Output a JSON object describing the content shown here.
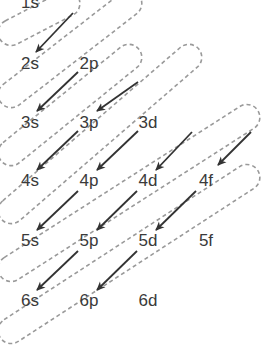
{
  "colors": {
    "label": "#3a3a3a",
    "arrow": "#333333",
    "ellipse": "#9a9a9a",
    "background": "#ffffff"
  },
  "orbitals": [
    {
      "id": "1s",
      "label": "1s",
      "x": 30,
      "y": 2
    },
    {
      "id": "2s",
      "label": "2s",
      "x": 30,
      "y": 63
    },
    {
      "id": "2p",
      "label": "2p",
      "x": 89,
      "y": 63
    },
    {
      "id": "3s",
      "label": "3s",
      "x": 30,
      "y": 122
    },
    {
      "id": "3p",
      "label": "3p",
      "x": 89,
      "y": 122
    },
    {
      "id": "3d",
      "label": "3d",
      "x": 148,
      "y": 122
    },
    {
      "id": "4s",
      "label": "4s",
      "x": 30,
      "y": 180
    },
    {
      "id": "4p",
      "label": "4p",
      "x": 89,
      "y": 180
    },
    {
      "id": "4d",
      "label": "4d",
      "x": 148,
      "y": 180
    },
    {
      "id": "4f",
      "label": "4f",
      "x": 206,
      "y": 180
    },
    {
      "id": "5s",
      "label": "5s",
      "x": 30,
      "y": 240
    },
    {
      "id": "5p",
      "label": "5p",
      "x": 89,
      "y": 240
    },
    {
      "id": "5d",
      "label": "5d",
      "x": 148,
      "y": 240
    },
    {
      "id": "5f",
      "label": "5f",
      "x": 206,
      "y": 240
    },
    {
      "id": "6s",
      "label": "6s",
      "x": 30,
      "y": 300
    },
    {
      "id": "6p",
      "label": "6p",
      "x": 89,
      "y": 300
    },
    {
      "id": "6d",
      "label": "6d",
      "x": 148,
      "y": 300
    }
  ],
  "arrows": [
    {
      "from": "1s",
      "to": "2s",
      "x1": 73,
      "y1": 13,
      "x2": 36,
      "y2": 52
    },
    {
      "from": "2p",
      "to": "3s",
      "x1": 78,
      "y1": 72,
      "x2": 37,
      "y2": 111
    },
    {
      "from": "3d",
      "to": "3p",
      "x1": 138,
      "y1": 82,
      "x2": 97,
      "y2": 111
    },
    {
      "from": "3p",
      "to": "4s",
      "x1": 78,
      "y1": 131,
      "x2": 37,
      "y2": 170
    },
    {
      "from": "4d",
      "to": "4p",
      "x1": 138,
      "y1": 131,
      "x2": 97,
      "y2": 170
    },
    {
      "from": "4f-top",
      "to": "4d",
      "x1": 192,
      "y1": 132,
      "x2": 156,
      "y2": 170
    },
    {
      "from": "4f-top2",
      "to": "4f",
      "x1": 251,
      "y1": 132,
      "x2": 218,
      "y2": 165
    },
    {
      "from": "4p",
      "to": "5s",
      "x1": 78,
      "y1": 191,
      "x2": 37,
      "y2": 230
    },
    {
      "from": "4d",
      "to": "5p",
      "x1": 137,
      "y1": 191,
      "x2": 97,
      "y2": 230
    },
    {
      "from": "4f",
      "to": "5d",
      "x1": 196,
      "y1": 191,
      "x2": 156,
      "y2": 230
    },
    {
      "from": "5p",
      "to": "6s",
      "x1": 78,
      "y1": 251,
      "x2": 37,
      "y2": 290
    },
    {
      "from": "5d",
      "to": "6p",
      "x1": 137,
      "y1": 251,
      "x2": 97,
      "y2": 290
    }
  ],
  "ellipses": [
    {
      "name": "group-1s",
      "x1": 72,
      "y1": 6,
      "x2": 8,
      "y2": 40
    },
    {
      "name": "group-2s",
      "x1": 72,
      "y1": -20,
      "x2": 8,
      "y2": 100
    },
    {
      "name": "group-3s",
      "x1": 130,
      "y1": 62,
      "x2": 8,
      "y2": 160
    },
    {
      "name": "group-4s",
      "x1": 130,
      "y1": 20,
      "x2": 8,
      "y2": 210
    },
    {
      "name": "group-5s",
      "x1": 190,
      "y1": 120,
      "x2": 8,
      "y2": 278
    },
    {
      "name": "group-6s",
      "x1": 250,
      "y1": 120,
      "x2": 8,
      "y2": 340
    }
  ]
}
